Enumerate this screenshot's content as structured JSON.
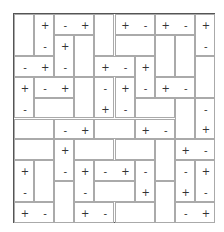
{
  "puzzle": {
    "type": "magnets",
    "rows": 10,
    "cols": 10,
    "dominoes": [
      {
        "r": 0,
        "c": 0,
        "o": "V",
        "s": [
          "",
          ""
        ]
      },
      {
        "r": 0,
        "c": 1,
        "o": "V",
        "s": [
          "+",
          "-"
        ]
      },
      {
        "r": 0,
        "c": 2,
        "o": "H",
        "s": [
          "-",
          "+"
        ]
      },
      {
        "r": 0,
        "c": 4,
        "o": "V",
        "s": [
          "",
          ""
        ]
      },
      {
        "r": 0,
        "c": 5,
        "o": "H",
        "s": [
          "+",
          "-"
        ]
      },
      {
        "r": 0,
        "c": 7,
        "o": "H",
        "s": [
          "+",
          "-"
        ]
      },
      {
        "r": 0,
        "c": 9,
        "o": "V",
        "s": [
          "+",
          "-"
        ]
      },
      {
        "r": 1,
        "c": 2,
        "o": "V",
        "s": [
          "+",
          "-"
        ]
      },
      {
        "r": 1,
        "c": 3,
        "o": "V",
        "s": [
          "",
          ""
        ]
      },
      {
        "r": 1,
        "c": 5,
        "o": "H",
        "s": [
          "",
          ""
        ]
      },
      {
        "r": 1,
        "c": 7,
        "o": "V",
        "s": [
          "",
          ""
        ]
      },
      {
        "r": 1,
        "c": 8,
        "o": "V",
        "s": [
          "",
          ""
        ]
      },
      {
        "r": 2,
        "c": 0,
        "o": "H",
        "s": [
          "-",
          "+"
        ]
      },
      {
        "r": 2,
        "c": 4,
        "o": "H",
        "s": [
          "+",
          "-"
        ]
      },
      {
        "r": 2,
        "c": 6,
        "o": "V",
        "s": [
          "+",
          "-"
        ]
      },
      {
        "r": 2,
        "c": 9,
        "o": "V",
        "s": [
          "",
          ""
        ]
      },
      {
        "r": 3,
        "c": 0,
        "o": "V",
        "s": [
          "+",
          "-"
        ]
      },
      {
        "r": 3,
        "c": 1,
        "o": "H",
        "s": [
          "-",
          "+"
        ]
      },
      {
        "r": 3,
        "c": 3,
        "o": "V",
        "s": [
          "",
          ""
        ]
      },
      {
        "r": 3,
        "c": 4,
        "o": "V",
        "s": [
          "-",
          "+"
        ]
      },
      {
        "r": 3,
        "c": 5,
        "o": "V",
        "s": [
          "+",
          "-"
        ]
      },
      {
        "r": 3,
        "c": 7,
        "o": "H",
        "s": [
          "+",
          "-"
        ]
      },
      {
        "r": 4,
        "c": 1,
        "o": "H",
        "s": [
          "",
          ""
        ]
      },
      {
        "r": 4,
        "c": 6,
        "o": "H",
        "s": [
          "",
          ""
        ]
      },
      {
        "r": 4,
        "c": 8,
        "o": "V",
        "s": [
          "",
          ""
        ]
      },
      {
        "r": 4,
        "c": 9,
        "o": "V",
        "s": [
          "-",
          "+"
        ]
      },
      {
        "r": 5,
        "c": 0,
        "o": "H",
        "s": [
          "",
          ""
        ]
      },
      {
        "r": 5,
        "c": 2,
        "o": "H",
        "s": [
          "-",
          "+"
        ]
      },
      {
        "r": 5,
        "c": 4,
        "o": "H",
        "s": [
          "",
          ""
        ]
      },
      {
        "r": 5,
        "c": 6,
        "o": "H",
        "s": [
          "+",
          "-"
        ]
      },
      {
        "r": 6,
        "c": 0,
        "o": "H",
        "s": [
          "",
          ""
        ]
      },
      {
        "r": 6,
        "c": 2,
        "o": "V",
        "s": [
          "+",
          "-"
        ]
      },
      {
        "r": 6,
        "c": 3,
        "o": "H",
        "s": [
          "",
          ""
        ]
      },
      {
        "r": 6,
        "c": 5,
        "o": "H",
        "s": [
          "",
          ""
        ]
      },
      {
        "r": 6,
        "c": 7,
        "o": "V",
        "s": [
          "",
          ""
        ]
      },
      {
        "r": 6,
        "c": 8,
        "o": "H",
        "s": [
          "+",
          "-"
        ]
      },
      {
        "r": 7,
        "c": 0,
        "o": "V",
        "s": [
          "+",
          "-"
        ]
      },
      {
        "r": 7,
        "c": 1,
        "o": "V",
        "s": [
          "",
          ""
        ]
      },
      {
        "r": 7,
        "c": 3,
        "o": "V",
        "s": [
          "+",
          "-"
        ]
      },
      {
        "r": 7,
        "c": 4,
        "o": "H",
        "s": [
          "-",
          "+"
        ]
      },
      {
        "r": 7,
        "c": 6,
        "o": "V",
        "s": [
          "-",
          "+"
        ]
      },
      {
        "r": 7,
        "c": 8,
        "o": "V",
        "s": [
          "-",
          "+"
        ]
      },
      {
        "r": 7,
        "c": 9,
        "o": "V",
        "s": [
          "+",
          "-"
        ]
      },
      {
        "r": 8,
        "c": 2,
        "o": "V",
        "s": [
          "",
          ""
        ]
      },
      {
        "r": 8,
        "c": 4,
        "o": "H",
        "s": [
          "",
          ""
        ]
      },
      {
        "r": 8,
        "c": 7,
        "o": "V",
        "s": [
          "",
          ""
        ]
      },
      {
        "r": 9,
        "c": 0,
        "o": "H",
        "s": [
          "+",
          "-"
        ]
      },
      {
        "r": 9,
        "c": 3,
        "o": "H",
        "s": [
          "+",
          "-"
        ]
      },
      {
        "r": 9,
        "c": 5,
        "o": "H",
        "s": [
          "",
          ""
        ]
      },
      {
        "r": 9,
        "c": 8,
        "o": "H",
        "s": [
          "-",
          "+"
        ]
      }
    ]
  }
}
